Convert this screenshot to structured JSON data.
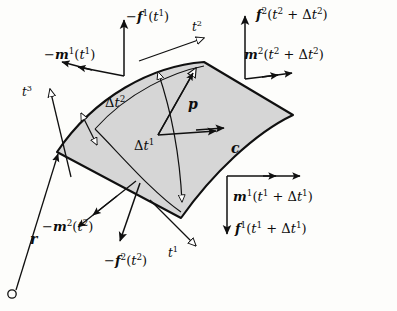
{
  "figure": {
    "background_color": "#fdfdfb",
    "patch_fill": "#d6d6d6",
    "stroke_color": "#101010"
  },
  "axes": [
    {
      "name": "t1",
      "label_html": "<i>t</i><sup>1</sup>",
      "x": 168,
      "y": 247,
      "arrow": "hollow"
    },
    {
      "name": "t2",
      "label_html": "<i>t</i><sup>2</sup>",
      "x": 192,
      "y": 21,
      "arrow": "hollow"
    },
    {
      "name": "t3",
      "label_html": "<i>t</i><sup>3</sup>",
      "x": 22,
      "y": 86,
      "arrow": "hollow"
    }
  ],
  "vectors": [
    {
      "name": "neg-f1-t1",
      "label_html": "&minus;<b>f</b><sup>1</sup>(<i>t</i><sup>1</sup>)",
      "x": 126,
      "y": 10,
      "arrow": "solid-single"
    },
    {
      "name": "neg-m1-t1",
      "label_html": "&minus;<b>m</b><sup>1</sup>(<i>t</i><sup>1</sup>)",
      "x": 44,
      "y": 48,
      "arrow": "solid-double"
    },
    {
      "name": "f2-t2-dt2",
      "label_html": "<b>f</b><sup>2</sup>(<i>t</i><sup>2</sup> + &Delta;<i>t</i><sup>2</sup>)",
      "x": 256,
      "y": 8,
      "arrow": "solid-single"
    },
    {
      "name": "m2-t2-dt2",
      "label_html": "<b>m</b><sup>2</sup>(<i>t</i><sup>2</sup> + &Delta;<i>t</i><sup>2</sup>)",
      "x": 244,
      "y": 48,
      "arrow": "solid-double"
    },
    {
      "name": "m1-t1-dt1",
      "label_html": "<b>m</b><sup>1</sup>(<i>t</i><sup>1</sup> + &Delta;<i>t</i><sup>1</sup>)",
      "x": 233,
      "y": 190,
      "arrow": "solid-double"
    },
    {
      "name": "f1-t1-dt1",
      "label_html": "<b>f</b><sup>1</sup>(<i>t</i><sup>1</sup> + &Delta;<i>t</i><sup>1</sup>)",
      "x": 235,
      "y": 222,
      "arrow": "solid-single"
    },
    {
      "name": "neg-m2-t2",
      "label_html": "&minus;<b>m</b><sup>2</sup>(<i>t</i><sup>2</sup>)",
      "x": 42,
      "y": 220,
      "arrow": "solid-double"
    },
    {
      "name": "neg-f2-t2",
      "label_html": "&minus;<b>f</b><sup>2</sup>(<i>t</i><sup>2</sup>)",
      "x": 104,
      "y": 254,
      "arrow": "solid-single"
    },
    {
      "name": "p-vector",
      "label_html": "<b>p</b>",
      "x": 188,
      "y": 97,
      "arrow": "hollow"
    },
    {
      "name": "c-vector",
      "label_html": "<b>c</b>",
      "x": 231,
      "y": 141,
      "arrow": "solid-double"
    },
    {
      "name": "r-vector",
      "label_html": "<b>r</b>",
      "x": 30,
      "y": 232,
      "arrow": "solid-single"
    }
  ],
  "dimensions": [
    {
      "name": "delta-t2",
      "label_html": "&Delta;<i>t</i><sup>2</sup>",
      "x": 105,
      "y": 96,
      "arrow": "hollow-double"
    },
    {
      "name": "delta-t1",
      "label_html": "&Delta;<i>t</i><sup>1</sup>",
      "x": 134,
      "y": 139,
      "arrow": "hollow-double"
    }
  ],
  "origin_marker": {
    "name": "origin-circle",
    "cx": 12,
    "cy": 294,
    "r": 4
  }
}
